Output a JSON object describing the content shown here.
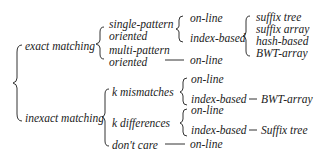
{
  "diagram": {
    "root": {
      "children": [
        {
          "label": "exact matching",
          "children": [
            {
              "label_line1": "single-pattern",
              "label_line2": "oriented",
              "children": [
                {
                  "label": "on-line"
                },
                {
                  "label": "index-based",
                  "children": [
                    "suffix tree",
                    "suffix array",
                    "hash-based",
                    "BWT-array"
                  ]
                }
              ]
            },
            {
              "label_line1": "multi-pattern",
              "label_line2": "oriented",
              "children": [
                {
                  "label": "on-line"
                }
              ]
            }
          ]
        },
        {
          "label": "inexact matching",
          "children": [
            {
              "label": "k mismatches",
              "children": [
                {
                  "label": "on-line"
                },
                {
                  "label": "index-based",
                  "leaf": "BWT-array"
                }
              ]
            },
            {
              "label": "k differences",
              "children": [
                {
                  "label": "on-line"
                },
                {
                  "label": "index-based",
                  "leaf": "Suffix tree"
                }
              ]
            },
            {
              "label": "don't care",
              "children": [
                {
                  "label": "on-line"
                }
              ]
            }
          ]
        }
      ]
    }
  },
  "labels": {
    "exact": "exact matching",
    "inexact": "inexact matching",
    "single1": "single-pattern",
    "single2": "oriented",
    "multi1": "multi-pattern",
    "multi2": "oriented",
    "sp_online": "on-line",
    "sp_index": "index-based",
    "suffix_tree": "suffix tree",
    "suffix_array": "suffix array",
    "hash_based": "hash-based",
    "bwt_array": "BWT-array",
    "mp_online": "on-line",
    "k_mismatches": "k mismatches",
    "km_online": "on-line",
    "km_index": "index-based",
    "km_leaf": "BWT-array",
    "k_differences": "k differences",
    "kd_online": "on-line",
    "kd_index": "index-based",
    "kd_leaf": "Suffix tree",
    "dont_care": "don't care",
    "dc_online": "on-line"
  }
}
